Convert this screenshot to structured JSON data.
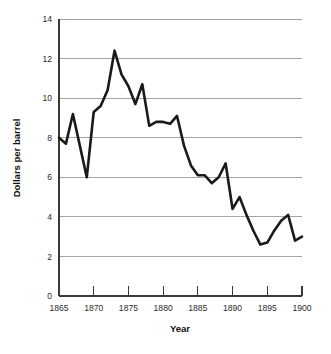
{
  "chart_data": {
    "type": "line",
    "title": "",
    "xlabel": "Year",
    "ylabel": "Dollars per barrel",
    "xlim": [
      1865,
      1900
    ],
    "ylim": [
      0,
      14
    ],
    "grid": true,
    "legend": false,
    "legend_position": "none",
    "line_color": "#1a1a1a",
    "grid_color": "#8d8d8d",
    "axis_color": "#3a3a3a",
    "xticks": [
      1865,
      1870,
      1875,
      1880,
      1885,
      1890,
      1895,
      1900
    ],
    "xtick_labels": [
      "1865",
      "1870",
      "1875",
      "1880",
      "1885",
      "1890",
      "1895",
      "1900"
    ],
    "yticks": [
      0,
      2,
      4,
      6,
      8,
      10,
      12,
      14
    ],
    "ytick_labels": [
      "0",
      "2",
      "4",
      "6",
      "8",
      "10",
      "12",
      "14"
    ],
    "series": [
      {
        "name": "Dollars per barrel",
        "x": [
          1865,
          1866,
          1867,
          1868,
          1869,
          1870,
          1871,
          1872,
          1873,
          1874,
          1875,
          1876,
          1877,
          1878,
          1879,
          1880,
          1881,
          1882,
          1883,
          1884,
          1885,
          1886,
          1887,
          1888,
          1889,
          1890,
          1891,
          1892,
          1893,
          1894,
          1895,
          1896,
          1897,
          1898,
          1899,
          1900
        ],
        "values": [
          8.0,
          7.7,
          9.2,
          7.6,
          6.0,
          9.3,
          9.6,
          10.4,
          12.4,
          11.2,
          10.6,
          9.7,
          10.7,
          8.6,
          8.8,
          8.8,
          8.7,
          9.1,
          7.6,
          6.6,
          6.1,
          6.1,
          5.7,
          6.0,
          6.7,
          4.4,
          5.0,
          4.1,
          3.3,
          2.6,
          2.7,
          3.3,
          3.8,
          4.1,
          2.8,
          3.0
        ]
      }
    ]
  },
  "axes": {
    "xlabel": "Year",
    "ylabel": "Dollars per barrel"
  }
}
